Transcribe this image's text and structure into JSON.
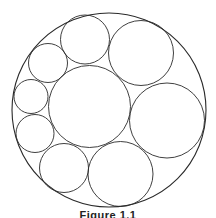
{
  "figure": {
    "caption": "Figure 1.1",
    "stroke_color": "#2a2a2a",
    "background": "#ffffff",
    "circles": [
      {
        "name": "outer-circle"
      },
      {
        "name": "center-large-circle"
      },
      {
        "name": "top-middle-circle"
      },
      {
        "name": "top-right-circle"
      },
      {
        "name": "right-circle"
      },
      {
        "name": "bottom-right-circle"
      },
      {
        "name": "bottom-left-circle"
      },
      {
        "name": "left-lower-circle"
      },
      {
        "name": "left-middle-circle"
      },
      {
        "name": "upper-left-circle"
      }
    ]
  }
}
